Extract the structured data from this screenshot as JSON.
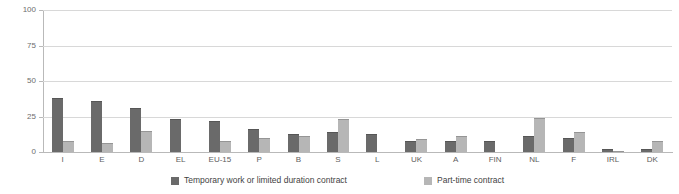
{
  "chart_data": {
    "type": "bar",
    "title": "",
    "xlabel": "",
    "ylabel": "",
    "ylim": [
      0,
      100
    ],
    "yticks": [
      0,
      25,
      50,
      75,
      100
    ],
    "grid": true,
    "legend_position": "bottom",
    "categories": [
      "I",
      "E",
      "D",
      "EL",
      "EU-15",
      "P",
      "B",
      "S",
      "L",
      "UK",
      "A",
      "FIN",
      "NL",
      "F",
      "IRL",
      "DK"
    ],
    "series": [
      {
        "name": "Temporary work or limited duration contract",
        "color": "#6a6a6a",
        "values": [
          38,
          36,
          31,
          23,
          22,
          16,
          13,
          14,
          13,
          8,
          8,
          8,
          11,
          10,
          2,
          2
        ]
      },
      {
        "name": "Part-time contract",
        "color": "#b6b6b6",
        "values": [
          8,
          6,
          15,
          0,
          8,
          10,
          11,
          23,
          0,
          9,
          11,
          0,
          24,
          14,
          1,
          8
        ]
      }
    ]
  },
  "axis": {
    "y_tick_labels": [
      "0",
      "25",
      "50",
      "75",
      "100"
    ]
  },
  "legend": {
    "items": [
      {
        "label": "Temporary work or limited duration contract",
        "swatch": "temp"
      },
      {
        "label": "Part-time contract",
        "swatch": "part"
      }
    ]
  },
  "colors": {
    "temporary": "#6a6a6a",
    "parttime": "#b6b6b6",
    "grid": "#d8d8d8",
    "axis": "#b9b9b9",
    "text": "#5d5d5d",
    "background": "#ffffff"
  }
}
